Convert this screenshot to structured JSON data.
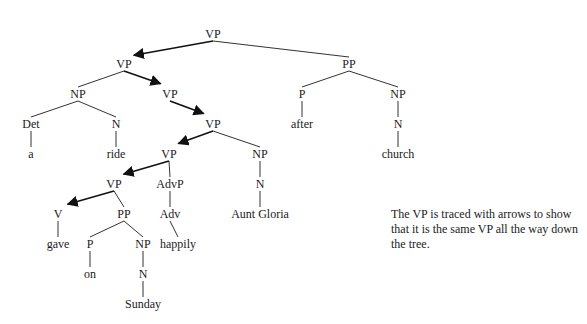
{
  "tree": {
    "nodes": [
      {
        "id": "vp0",
        "label": "VP",
        "x": 213,
        "y": 38
      },
      {
        "id": "vp1",
        "label": "VP",
        "x": 124,
        "y": 68
      },
      {
        "id": "pp1",
        "label": "PP",
        "x": 349,
        "y": 68
      },
      {
        "id": "np1",
        "label": "NP",
        "x": 78,
        "y": 98
      },
      {
        "id": "vp2",
        "label": "VP",
        "x": 170,
        "y": 98
      },
      {
        "id": "p1",
        "label": "P",
        "x": 302,
        "y": 98
      },
      {
        "id": "np2",
        "label": "NP",
        "x": 398,
        "y": 98
      },
      {
        "id": "det",
        "label": "Det",
        "x": 31,
        "y": 128
      },
      {
        "id": "n1",
        "label": "N",
        "x": 116,
        "y": 128
      },
      {
        "id": "vp3",
        "label": "VP",
        "x": 213,
        "y": 128
      },
      {
        "id": "after",
        "label": "after",
        "x": 302,
        "y": 128
      },
      {
        "id": "n2",
        "label": "N",
        "x": 398,
        "y": 128
      },
      {
        "id": "a",
        "label": "a",
        "x": 31,
        "y": 158
      },
      {
        "id": "ride",
        "label": "ride",
        "x": 116,
        "y": 158
      },
      {
        "id": "vp4",
        "label": "VP",
        "x": 169,
        "y": 158
      },
      {
        "id": "np3",
        "label": "NP",
        "x": 260,
        "y": 158
      },
      {
        "id": "church",
        "label": "church",
        "x": 398,
        "y": 158
      },
      {
        "id": "vp5",
        "label": "VP",
        "x": 114,
        "y": 188
      },
      {
        "id": "advp",
        "label": "AdvP",
        "x": 170,
        "y": 188
      },
      {
        "id": "n3",
        "label": "N",
        "x": 260,
        "y": 188
      },
      {
        "id": "v",
        "label": "V",
        "x": 58,
        "y": 218
      },
      {
        "id": "pp2",
        "label": "PP",
        "x": 124,
        "y": 218
      },
      {
        "id": "adv",
        "label": "Adv",
        "x": 170,
        "y": 218
      },
      {
        "id": "auntgloria",
        "label": "Aunt Gloria",
        "x": 260,
        "y": 218
      },
      {
        "id": "gave",
        "label": "gave",
        "x": 58,
        "y": 248
      },
      {
        "id": "p2",
        "label": "P",
        "x": 90,
        "y": 248
      },
      {
        "id": "np4",
        "label": "NP",
        "x": 143,
        "y": 248
      },
      {
        "id": "happily",
        "label": "happily",
        "x": 178,
        "y": 248
      },
      {
        "id": "on",
        "label": "on",
        "x": 90,
        "y": 278
      },
      {
        "id": "n4",
        "label": "N",
        "x": 143,
        "y": 278
      },
      {
        "id": "sunday",
        "label": "Sunday",
        "x": 143,
        "y": 308
      }
    ],
    "edges": [
      {
        "from": "vp0",
        "to": "pp1",
        "arrow": false
      },
      {
        "from": "vp1",
        "to": "np1",
        "arrow": false
      },
      {
        "from": "pp1",
        "to": "p1",
        "arrow": false
      },
      {
        "from": "pp1",
        "to": "np2",
        "arrow": false
      },
      {
        "from": "np1",
        "to": "det",
        "arrow": false
      },
      {
        "from": "np1",
        "to": "n1",
        "arrow": false
      },
      {
        "from": "det",
        "to": "a",
        "arrow": false
      },
      {
        "from": "n1",
        "to": "ride",
        "arrow": false
      },
      {
        "from": "p1",
        "to": "after",
        "arrow": false
      },
      {
        "from": "np2",
        "to": "n2",
        "arrow": false
      },
      {
        "from": "n2",
        "to": "church",
        "arrow": false
      },
      {
        "from": "vp3",
        "to": "np3",
        "arrow": false
      },
      {
        "from": "np3",
        "to": "n3",
        "arrow": false
      },
      {
        "from": "n3",
        "to": "auntgloria",
        "arrow": false
      },
      {
        "from": "vp4",
        "to": "advp",
        "arrow": false
      },
      {
        "from": "advp",
        "to": "adv",
        "arrow": false
      },
      {
        "from": "adv",
        "to": "happily",
        "arrow": false
      },
      {
        "from": "vp5",
        "to": "pp2",
        "arrow": false
      },
      {
        "from": "v",
        "to": "gave",
        "arrow": false
      },
      {
        "from": "pp2",
        "to": "p2",
        "arrow": false
      },
      {
        "from": "pp2",
        "to": "np4",
        "arrow": false
      },
      {
        "from": "p2",
        "to": "on",
        "arrow": false
      },
      {
        "from": "np4",
        "to": "n4",
        "arrow": false
      },
      {
        "from": "n4",
        "to": "sunday",
        "arrow": false
      },
      {
        "from": "vp0",
        "to": "vp1",
        "arrow": true
      },
      {
        "from": "vp1",
        "to": "vp2",
        "arrow": true
      },
      {
        "from": "vp2",
        "to": "vp3",
        "arrow": true
      },
      {
        "from": "vp3",
        "to": "vp4",
        "arrow": true
      },
      {
        "from": "vp4",
        "to": "vp5",
        "arrow": true
      },
      {
        "from": "vp5",
        "to": "v",
        "arrow": true
      }
    ]
  },
  "note": {
    "text": "The VP is traced with arrows to show that it is the same VP all the way down the tree."
  }
}
